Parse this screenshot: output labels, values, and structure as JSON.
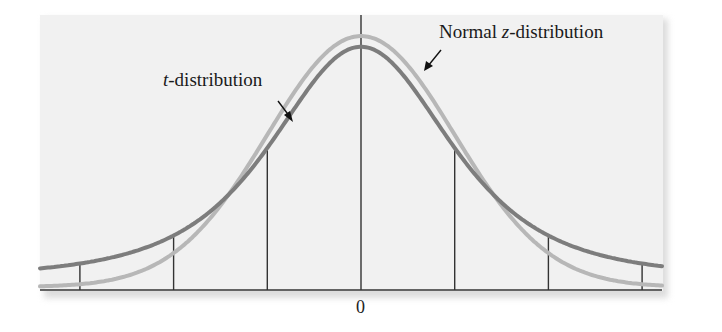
{
  "chart_data": {
    "type": "line",
    "title": "",
    "xlabel": "",
    "ylabel": "",
    "x_tick_labels": [
      "0"
    ],
    "x_reference_lines_sd": [
      -3,
      -2,
      -1,
      0,
      1,
      2,
      3
    ],
    "xlim": [
      -3.4,
      3.7
    ],
    "grid": false,
    "legend_position": "annotations",
    "series": [
      {
        "name": "Normal z-distribution",
        "color": "#b7b7b7",
        "x": [
          -3,
          -2,
          -1,
          0,
          1,
          2,
          3
        ],
        "values": [
          0.004,
          0.054,
          0.242,
          0.399,
          0.242,
          0.054,
          0.004
        ]
      },
      {
        "name": "t-distribution",
        "color": "#7d7d7d",
        "x": [
          -3,
          -2,
          -1,
          0,
          1,
          2,
          3
        ],
        "values": [
          0.023,
          0.068,
          0.207,
          0.354,
          0.207,
          0.068,
          0.023
        ]
      }
    ],
    "annotations": [
      {
        "text_italic": "t",
        "text_rest": "-distribution",
        "points_to": "t-distribution"
      },
      {
        "text_prefix": "Normal ",
        "text_italic": "z",
        "text_rest": "-distribution",
        "points_to": "Normal z-distribution"
      }
    ]
  },
  "labels": {
    "t_italic": "t",
    "t_rest": "-distribution",
    "z_prefix": "Normal ",
    "z_italic": "z",
    "z_rest": "-distribution",
    "zero": "0"
  },
  "colors": {
    "panel": "#f1f1f1",
    "normal_curve": "#b7b7b7",
    "t_curve": "#7d7d7d",
    "axis": "#333333"
  }
}
